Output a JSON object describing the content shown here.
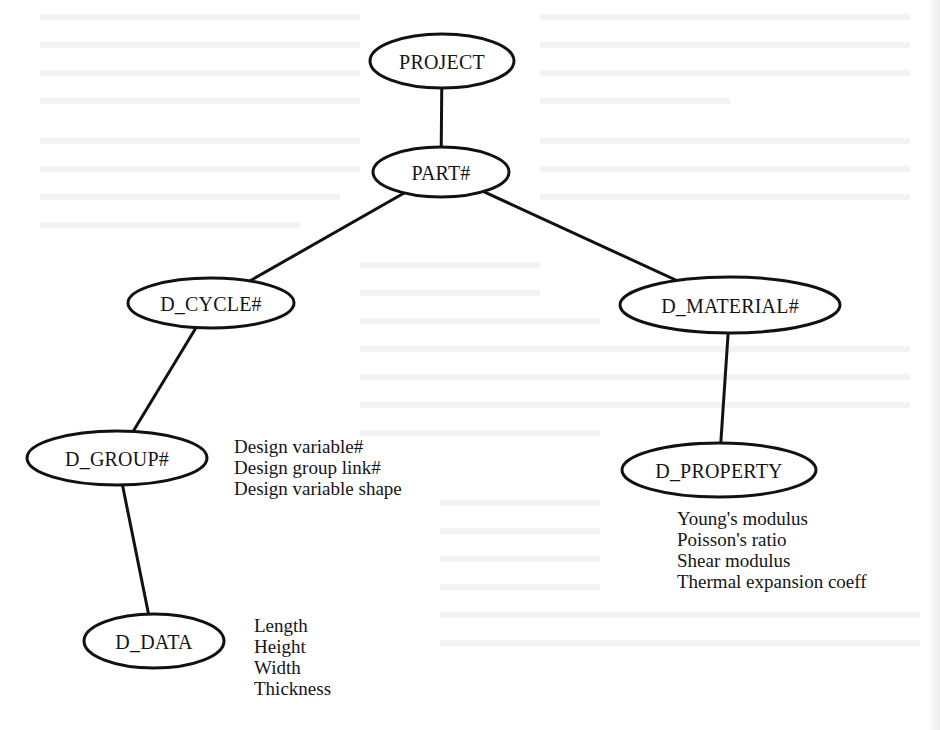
{
  "diagram": {
    "type": "hierarchical tree",
    "nodes": [
      {
        "id": "project",
        "label": "PROJECT",
        "cx": 442,
        "cy": 61,
        "rx": 72,
        "ry": 27
      },
      {
        "id": "part",
        "label": "PART#",
        "cx": 441,
        "cy": 172,
        "rx": 68,
        "ry": 25
      },
      {
        "id": "d_cycle",
        "label": "D_CYCLE#",
        "cx": 211,
        "cy": 303,
        "rx": 83,
        "ry": 25
      },
      {
        "id": "d_material",
        "label": "D_MATERIAL#",
        "cx": 730,
        "cy": 305,
        "rx": 110,
        "ry": 28
      },
      {
        "id": "d_group",
        "label": "D_GROUP#",
        "cx": 117,
        "cy": 458,
        "rx": 90,
        "ry": 27
      },
      {
        "id": "d_property",
        "label": "D_PROPERTY",
        "cx": 719,
        "cy": 470,
        "rx": 97,
        "ry": 27
      },
      {
        "id": "d_data",
        "label": "D_DATA",
        "cx": 154,
        "cy": 641,
        "rx": 70,
        "ry": 27
      }
    ],
    "edges": [
      {
        "from": "project",
        "to": "part"
      },
      {
        "from": "part",
        "to": "d_cycle"
      },
      {
        "from": "part",
        "to": "d_material"
      },
      {
        "from": "d_cycle",
        "to": "d_group"
      },
      {
        "from": "d_material",
        "to": "d_property"
      },
      {
        "from": "d_group",
        "to": "d_data"
      }
    ],
    "attributes": {
      "d_group": [
        "Design variable#",
        "Design group link#",
        "Design variable shape"
      ],
      "d_property": [
        "Young's modulus",
        "Poisson's ratio",
        "Shear modulus",
        "Thermal expansion coeff"
      ],
      "d_data": [
        "Length",
        "Height",
        "Width",
        "Thickness"
      ]
    }
  },
  "colors": {
    "line": "#111111",
    "background": "#ffffff"
  }
}
